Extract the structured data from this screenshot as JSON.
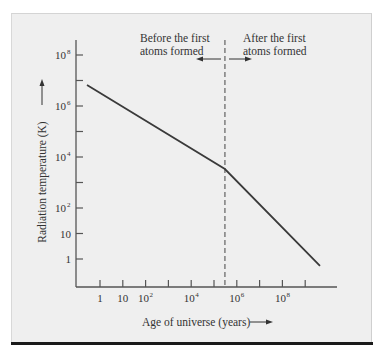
{
  "chart_data": {
    "type": "line",
    "title": "",
    "xlabel": "Age of universe (years)",
    "ylabel": "Radiation temperature (K)",
    "x_scale": "log",
    "y_scale": "log",
    "xlim": [
      0.1,
      10000000000
    ],
    "ylim": [
      0.1,
      1000000000
    ],
    "x_tick_positions_log10": [
      0,
      1,
      2,
      3,
      4,
      5,
      6,
      7,
      8,
      9
    ],
    "x_tick_labels": [
      {
        "base": "1",
        "exp": ""
      },
      {
        "base": "10",
        "exp": ""
      },
      {
        "base": "10",
        "exp": "2"
      },
      {
        "base": "",
        "exp": ""
      },
      {
        "base": "10",
        "exp": "4"
      },
      {
        "base": "",
        "exp": ""
      },
      {
        "base": "10",
        "exp": "6"
      },
      {
        "base": "",
        "exp": ""
      },
      {
        "base": "10",
        "exp": "8"
      },
      {
        "base": "",
        "exp": ""
      }
    ],
    "y_tick_positions_log10": [
      0,
      1,
      2,
      3,
      4,
      5,
      6,
      7,
      8
    ],
    "y_tick_labels": [
      {
        "base": "1",
        "exp": ""
      },
      {
        "base": "10",
        "exp": ""
      },
      {
        "base": "10",
        "exp": "2"
      },
      {
        "base": "",
        "exp": ""
      },
      {
        "base": "10",
        "exp": "4"
      },
      {
        "base": "",
        "exp": ""
      },
      {
        "base": "10",
        "exp": "6"
      },
      {
        "base": "",
        "exp": ""
      },
      {
        "base": "10",
        "exp": "8"
      }
    ],
    "grid": false,
    "legend": null,
    "series": [
      {
        "name": "Radiation temperature",
        "points_log10": [
          {
            "x": -0.57,
            "y": 6.82
          },
          {
            "x": 5.48,
            "y": 3.53
          },
          {
            "x": 9.65,
            "y": -0.27
          }
        ],
        "points": [
          {
            "x": 0.27,
            "y": 6600000
          },
          {
            "x": 300000,
            "y": 3400
          },
          {
            "x": 4500000000,
            "y": 0.54
          }
        ]
      }
    ],
    "annotations": [
      {
        "type": "vertical-dashed-line",
        "x": 300000,
        "x_log10": 5.48
      },
      {
        "text_lines": [
          "Before the first",
          "atoms formed"
        ],
        "arrow": "left"
      },
      {
        "text_lines": [
          "After the first",
          "atoms formed"
        ],
        "arrow": "right"
      }
    ]
  },
  "labels": {
    "xlabel": "Age of universe (years)",
    "ylabel": "Radiation temperature (K)",
    "before_line1": "Before the first",
    "before_line2": "atoms formed",
    "after_line1": "After the first",
    "after_line2": "atoms formed"
  },
  "colors": {
    "panel_bg": "#efefef",
    "line": "#3a3a3a",
    "axis": "#555555",
    "rule": "#1a1a1a"
  }
}
